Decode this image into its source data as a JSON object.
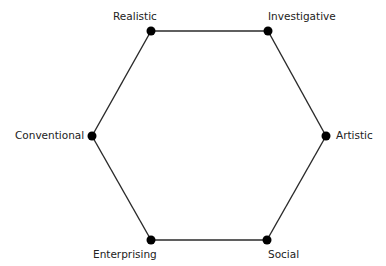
{
  "diagram": {
    "type": "hexagon",
    "colors": {
      "line": "#2a2a2a",
      "node": "#000000",
      "text": "#222222",
      "background": "#ffffff"
    },
    "nodes": [
      {
        "id": "realistic",
        "label": "Realistic",
        "x": 151,
        "y": 31
      },
      {
        "id": "investigative",
        "label": "Investigative",
        "x": 268,
        "y": 31
      },
      {
        "id": "artistic",
        "label": "Artistic",
        "x": 326,
        "y": 136
      },
      {
        "id": "social",
        "label": "Social",
        "x": 267,
        "y": 240
      },
      {
        "id": "enterprising",
        "label": "Enterprising",
        "x": 151,
        "y": 240
      },
      {
        "id": "conventional",
        "label": "Conventional",
        "x": 92,
        "y": 136
      }
    ],
    "edges": [
      [
        "realistic",
        "investigative"
      ],
      [
        "investigative",
        "artistic"
      ],
      [
        "artistic",
        "social"
      ],
      [
        "social",
        "enterprising"
      ],
      [
        "enterprising",
        "conventional"
      ],
      [
        "conventional",
        "realistic"
      ]
    ]
  }
}
